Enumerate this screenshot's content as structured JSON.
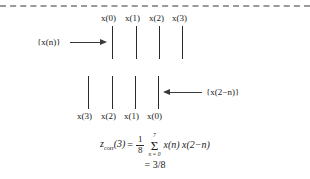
{
  "figure": {
    "background_color": "#ffffff",
    "ink_color": "#1a1a1a",
    "rule_color": "#9a9a9a",
    "caption_note": "Circular correlation illustration: sequence x(n) against time-reversed shifted sequence x(2-n)"
  },
  "top_rule": {
    "style": "dashed",
    "name": "top-dashed-rule"
  },
  "sequence_top": {
    "label": "{x(n)}",
    "arrow_direction": "right",
    "stem_labels": [
      "x(0)",
      "x(1)",
      "x(2)",
      "x(3)"
    ],
    "stem_count": 4
  },
  "sequence_bottom": {
    "label": "{x(2−n)}",
    "arrow_direction": "left",
    "stem_labels": [
      "x(3)",
      "x(2)",
      "x(1)",
      "x(0)"
    ],
    "stem_count": 4
  },
  "equation": {
    "lhs": "z",
    "lhs_subscript": "corr",
    "lhs_arg": "(3)",
    "equals": "=",
    "fraction_numerator": "1",
    "fraction_denominator": "8",
    "sigma": "Σ",
    "sigma_upper": "7",
    "sigma_lower": "n = 0",
    "summand": "x(n) x(2−n)",
    "result_line": "= 3/8"
  }
}
